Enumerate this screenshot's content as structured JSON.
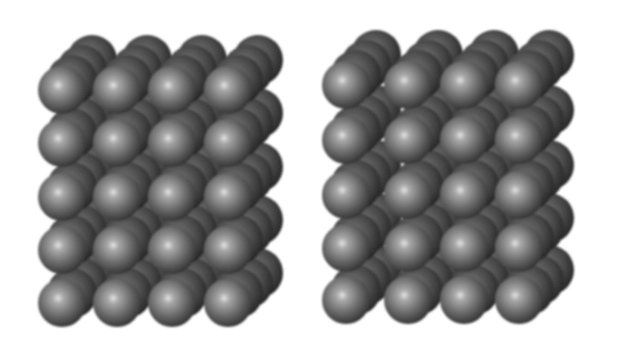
{
  "figure": {
    "background": "#ffffff",
    "sphere_color_light": "#d8d8d8",
    "sphere_color_mid": "#6e6e6e",
    "sphere_color_dark": "#2e2e2e",
    "panels": [
      {
        "name": "left-lattice",
        "columns": 4,
        "rows": 5,
        "depth_layers": 4,
        "front_x": [
          62,
          117,
          172,
          228
        ],
        "front_y": [
          90,
          143,
          197,
          250,
          303
        ],
        "radius": 24,
        "depth_dx": 10,
        "depth_dy": -10
      },
      {
        "name": "right-lattice",
        "columns": 4,
        "rows": 5,
        "depth_layers": 4,
        "front_x": [
          346,
          408,
          464,
          519
        ],
        "front_y": [
          85,
          140,
          195,
          248,
          300
        ],
        "radius": 24,
        "depth_dx": 10,
        "depth_dy": -10
      }
    ]
  }
}
